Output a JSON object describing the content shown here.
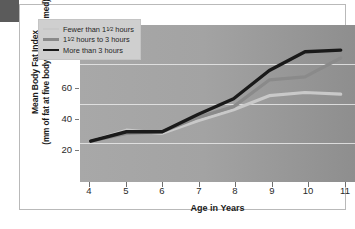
{
  "chart_data": {
    "type": "line",
    "title": "",
    "xlabel": "Age in Years",
    "ylabel_line1": "Mean Body Fat Index",
    "ylabel_line2": "(mm of fat at five body sites, summed)",
    "x": [
      4,
      5,
      6,
      7,
      8,
      9,
      10,
      11
    ],
    "xlim": [
      3.7,
      11.4
    ],
    "ylim": [
      0,
      100
    ],
    "xticks": [
      "4",
      "5",
      "6",
      "7",
      "8",
      "9",
      "10",
      "11"
    ],
    "yticks": [
      "20",
      "40",
      "60",
      "80",
      "100"
    ],
    "ytick_values": [
      20,
      40,
      60,
      80,
      100
    ],
    "gridlines": [
      25,
      50,
      75
    ],
    "grid": true,
    "legend_position": "top-left",
    "series": [
      {
        "name": "Fewer than 1½ hours",
        "name_prefix": "Fewer than 1",
        "name_fraction": "1/2",
        "name_suffix": " hours",
        "color": "#c9c9c9",
        "values": [
          26,
          33,
          31,
          39,
          46,
          55,
          57,
          56
        ]
      },
      {
        "name": "1½ hours to 3 hours",
        "name_prefix": "1",
        "name_fraction": "1/2",
        "name_suffix": " hours to 3 hours",
        "color": "#8a8a8a",
        "values": [
          26,
          31,
          32,
          41,
          48,
          65,
          67,
          79
        ]
      },
      {
        "name": "More than 3 hours",
        "name_prefix": "More than 3 hours",
        "name_fraction": "",
        "name_suffix": "",
        "color": "#1a1a1a",
        "values": [
          26,
          32,
          32,
          43,
          53,
          71,
          83,
          84
        ]
      }
    ]
  },
  "legend": {
    "items": [
      {
        "label_prefix": "Fewer than 1",
        "fraction_num": "1",
        "fraction_den": "2",
        "label_suffix": " hours"
      },
      {
        "label_prefix": "1",
        "fraction_num": "1",
        "fraction_den": "2",
        "label_suffix": " hours to 3 hours"
      },
      {
        "label_prefix": "More than 3 hours",
        "fraction_num": "",
        "fraction_den": "",
        "label_suffix": ""
      }
    ]
  },
  "colors": {
    "plot_background": "#a3a3a3",
    "gridline": "#e9e9e9",
    "legend_background": "#cfcfcf",
    "page_background": "#ffffff",
    "corner_tab": "#5b5b5b"
  }
}
